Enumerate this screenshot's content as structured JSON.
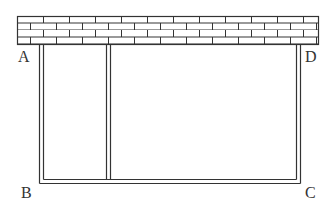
{
  "diagram": {
    "labels": {
      "A": "A",
      "B": "B",
      "C": "C",
      "D": "D"
    },
    "colors": {
      "line": "#333333",
      "background": "#ffffff"
    },
    "wall": {
      "rows": 4,
      "pattern": "brick"
    }
  }
}
